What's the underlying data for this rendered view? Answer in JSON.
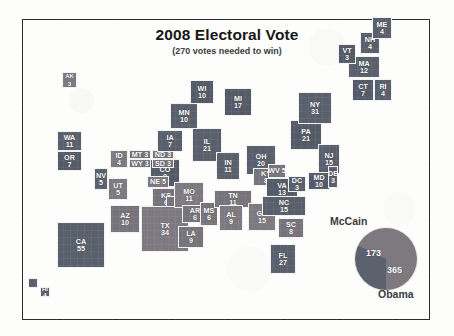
{
  "header": {
    "title": "2008 Electoral Vote",
    "subtitle": "(270 votes needed to win)"
  },
  "legend": {
    "mccain_label": "McCain",
    "obama_label": "Obama",
    "mccain_votes": "173",
    "obama_votes": "365"
  },
  "colors": {
    "democrat": "#595f6b",
    "republican": "#77737a",
    "frame": "#2b2b2b",
    "background": "#fdfdfc"
  },
  "chart_data": {
    "type": "pie",
    "title": "2008 Electoral Vote",
    "subtitle": "(270 votes needed to win)",
    "categories": [
      "Obama",
      "McCain"
    ],
    "values": [
      365,
      173
    ],
    "legend_position": "around-pie",
    "cartogram": {
      "type": "map",
      "note": "Grid cartogram of US states sized by electoral votes",
      "parties": {
        "D": "Obama",
        "R": "McCain"
      },
      "states": [
        {
          "ab": "AK",
          "ev": "3",
          "party": "R"
        },
        {
          "ab": "HI",
          "ev": "4",
          "party": "D"
        },
        {
          "ab": "WA",
          "ev": "11",
          "party": "D"
        },
        {
          "ab": "OR",
          "ev": "7",
          "party": "D"
        },
        {
          "ab": "CA",
          "ev": "55",
          "party": "D"
        },
        {
          "ab": "NV",
          "ev": "5",
          "party": "D"
        },
        {
          "ab": "ID",
          "ev": "4",
          "party": "R"
        },
        {
          "ab": "MT",
          "ev": "3",
          "party": "R"
        },
        {
          "ab": "WY",
          "ev": "3",
          "party": "R"
        },
        {
          "ab": "UT",
          "ev": "5",
          "party": "R"
        },
        {
          "ab": "AZ",
          "ev": "10",
          "party": "R"
        },
        {
          "ab": "NM",
          "ev": "5",
          "party": "D"
        },
        {
          "ab": "CO",
          "ev": "9",
          "party": "D"
        },
        {
          "ab": "ND",
          "ev": "3",
          "party": "R"
        },
        {
          "ab": "SD",
          "ev": "3",
          "party": "R"
        },
        {
          "ab": "NE",
          "ev": "5",
          "party": "R"
        },
        {
          "ab": "KS",
          "ev": "6",
          "party": "R"
        },
        {
          "ab": "OK",
          "ev": "7",
          "party": "R"
        },
        {
          "ab": "TX",
          "ev": "34",
          "party": "R"
        },
        {
          "ab": "MN",
          "ev": "10",
          "party": "D"
        },
        {
          "ab": "IA",
          "ev": "7",
          "party": "D"
        },
        {
          "ab": "MO",
          "ev": "11",
          "party": "R"
        },
        {
          "ab": "AR",
          "ev": "6",
          "party": "R"
        },
        {
          "ab": "LA",
          "ev": "9",
          "party": "R"
        },
        {
          "ab": "WI",
          "ev": "10",
          "party": "D"
        },
        {
          "ab": "IL",
          "ev": "21",
          "party": "D"
        },
        {
          "ab": "MS",
          "ev": "6",
          "party": "R"
        },
        {
          "ab": "MI",
          "ev": "17",
          "party": "D"
        },
        {
          "ab": "IN",
          "ev": "11",
          "party": "D"
        },
        {
          "ab": "TN",
          "ev": "11",
          "party": "R"
        },
        {
          "ab": "AL",
          "ev": "9",
          "party": "R"
        },
        {
          "ab": "OH",
          "ev": "20",
          "party": "D"
        },
        {
          "ab": "KY",
          "ev": "8",
          "party": "R"
        },
        {
          "ab": "GA",
          "ev": "15",
          "party": "R"
        },
        {
          "ab": "FL",
          "ev": "27",
          "party": "D"
        },
        {
          "ab": "WV",
          "ev": "5",
          "party": "R"
        },
        {
          "ab": "VA",
          "ev": "13",
          "party": "D"
        },
        {
          "ab": "NC",
          "ev": "15",
          "party": "D"
        },
        {
          "ab": "SC",
          "ev": "8",
          "party": "R"
        },
        {
          "ab": "PA",
          "ev": "21",
          "party": "D"
        },
        {
          "ab": "NY",
          "ev": "31",
          "party": "D"
        },
        {
          "ab": "NJ",
          "ev": "15",
          "party": "D"
        },
        {
          "ab": "MD",
          "ev": "10",
          "party": "D"
        },
        {
          "ab": "DE",
          "ev": "3",
          "party": "D"
        },
        {
          "ab": "DC",
          "ev": "3",
          "party": "D"
        },
        {
          "ab": "CT",
          "ev": "7",
          "party": "D"
        },
        {
          "ab": "RI",
          "ev": "4",
          "party": "D"
        },
        {
          "ab": "MA",
          "ev": "12",
          "party": "D"
        },
        {
          "ab": "VT",
          "ev": "3",
          "party": "D"
        },
        {
          "ab": "NH",
          "ev": "4",
          "party": "D"
        },
        {
          "ab": "ME",
          "ev": "4",
          "party": "D"
        }
      ]
    }
  }
}
